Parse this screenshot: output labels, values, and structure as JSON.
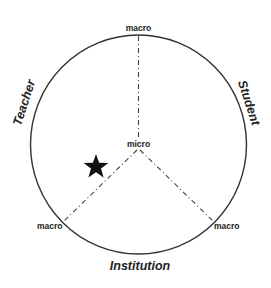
{
  "diagram": {
    "segments": {
      "teacher": "Teacher",
      "student": "Student",
      "institution": "Institution"
    },
    "scale": {
      "center": "micro",
      "top": "macro",
      "bottom_left": "macro",
      "bottom_right": "macro"
    },
    "marker": {
      "icon": "star-icon",
      "position": "teacher-institution sector, between micro and macro"
    },
    "colors": {
      "stroke": "#333333",
      "text": "#222222",
      "background": "#ffffff"
    }
  }
}
